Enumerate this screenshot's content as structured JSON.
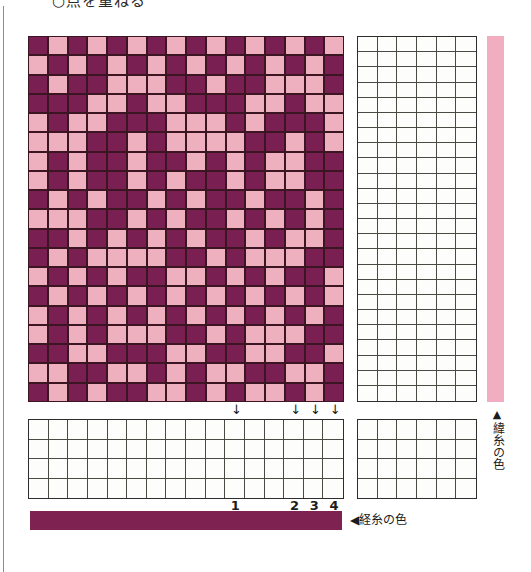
{
  "page": {
    "heading": "○点を重ねる",
    "background": "#ffffff"
  },
  "colors": {
    "warp": "#7a1f52",
    "weft": "#eeafbf",
    "warp_bar": "#7d2251",
    "weft_bar": "#f0aec0",
    "cell_outline": "#3b1622",
    "grid_line": "#4a4a42"
  },
  "drawdown": {
    "name": "woven-pattern-drawdown",
    "columns": 16,
    "rows": 19,
    "legend": {
      "warp_value": "warp",
      "weft_value": "weft"
    },
    "cells": [
      [
        "warp",
        "weft",
        "warp",
        "weft",
        "warp",
        "weft",
        "warp",
        "weft",
        "warp",
        "weft",
        "warp",
        "weft",
        "warp",
        "weft",
        "warp",
        "weft"
      ],
      [
        "weft",
        "warp",
        "weft",
        "warp",
        "weft",
        "warp",
        "weft",
        "warp",
        "weft",
        "warp",
        "weft",
        "warp",
        "weft",
        "warp",
        "weft",
        "warp"
      ],
      [
        "warp",
        "weft",
        "warp",
        "warp",
        "weft",
        "weft",
        "weft",
        "warp",
        "warp",
        "weft",
        "warp",
        "warp",
        "weft",
        "weft",
        "weft",
        "warp"
      ],
      [
        "warp",
        "warp",
        "warp",
        "weft",
        "weft",
        "warp",
        "weft",
        "weft",
        "warp",
        "warp",
        "warp",
        "weft",
        "weft",
        "warp",
        "weft",
        "weft"
      ],
      [
        "weft",
        "warp",
        "weft",
        "weft",
        "warp",
        "warp",
        "warp",
        "weft",
        "weft",
        "weft",
        "warp",
        "weft",
        "warp",
        "warp",
        "warp",
        "weft"
      ],
      [
        "weft",
        "weft",
        "weft",
        "warp",
        "warp",
        "weft",
        "warp",
        "weft",
        "weft",
        "weft",
        "weft",
        "warp",
        "warp",
        "weft",
        "warp",
        "weft"
      ],
      [
        "weft",
        "warp",
        "weft",
        "warp",
        "warp",
        "weft",
        "warp",
        "warp",
        "weft",
        "warp",
        "weft",
        "warp",
        "weft",
        "weft",
        "warp",
        "warp"
      ],
      [
        "weft",
        "warp",
        "weft",
        "warp",
        "warp",
        "weft",
        "warp",
        "weft",
        "warp",
        "warp",
        "weft",
        "warp",
        "weft",
        "weft",
        "warp",
        "warp"
      ],
      [
        "warp",
        "weft",
        "warp",
        "weft",
        "warp",
        "warp",
        "weft",
        "warp",
        "weft",
        "warp",
        "warp",
        "weft",
        "warp",
        "warp",
        "weft",
        "warp"
      ],
      [
        "weft",
        "weft",
        "weft",
        "warp",
        "warp",
        "weft",
        "warp",
        "weft",
        "warp",
        "warp",
        "weft",
        "warp",
        "weft",
        "warp",
        "weft",
        "warp"
      ],
      [
        "warp",
        "warp",
        "weft",
        "warp",
        "weft",
        "warp",
        "weft",
        "warp",
        "weft",
        "warp",
        "warp",
        "weft",
        "warp",
        "weft",
        "weft",
        "warp"
      ],
      [
        "warp",
        "weft",
        "warp",
        "weft",
        "weft",
        "weft",
        "weft",
        "warp",
        "warp",
        "weft",
        "warp",
        "weft",
        "weft",
        "weft",
        "warp",
        "warp"
      ],
      [
        "weft",
        "warp",
        "weft",
        "warp",
        "weft",
        "warp",
        "warp",
        "weft",
        "weft",
        "warp",
        "weft",
        "warp",
        "weft",
        "warp",
        "warp",
        "weft"
      ],
      [
        "warp",
        "weft",
        "warp",
        "weft",
        "warp",
        "weft",
        "warp",
        "weft",
        "warp",
        "weft",
        "warp",
        "weft",
        "warp",
        "weft",
        "warp",
        "weft"
      ],
      [
        "weft",
        "warp",
        "weft",
        "warp",
        "weft",
        "warp",
        "weft",
        "warp",
        "weft",
        "warp",
        "weft",
        "warp",
        "weft",
        "warp",
        "weft",
        "warp"
      ],
      [
        "weft",
        "warp",
        "weft",
        "warp",
        "weft",
        "weft",
        "weft",
        "warp",
        "warp",
        "weft",
        "warp",
        "weft",
        "weft",
        "weft",
        "warp",
        "warp"
      ],
      [
        "warp",
        "warp",
        "weft",
        "weft",
        "warp",
        "warp",
        "warp",
        "weft",
        "weft",
        "warp",
        "warp",
        "weft",
        "weft",
        "warp",
        "warp",
        "weft"
      ],
      [
        "weft",
        "weft",
        "warp",
        "warp",
        "weft",
        "weft",
        "warp",
        "weft",
        "warp",
        "weft",
        "weft",
        "warp",
        "warp",
        "weft",
        "weft",
        "warp"
      ],
      [
        "warp",
        "weft",
        "warp",
        "weft",
        "warp",
        "warp",
        "weft",
        "weft",
        "warp",
        "weft",
        "warp",
        "weft",
        "weft",
        "warp",
        "weft",
        "warp"
      ]
    ]
  },
  "threading_grid": {
    "name": "threading-grid",
    "columns": 6,
    "rows": 24,
    "marks": []
  },
  "treadling_grid": {
    "name": "treadling-grid",
    "columns": 16,
    "rows": 4,
    "marks": []
  },
  "tieup_grid": {
    "name": "tieup-grid",
    "columns": 6,
    "rows": 4,
    "marks": []
  },
  "treadle_markers": [
    {
      "label": "1",
      "column": 11
    },
    {
      "label": "2",
      "column": 14
    },
    {
      "label": "3",
      "column": 15
    },
    {
      "label": "4",
      "column": 16
    }
  ],
  "captions": {
    "weft_color": {
      "triangle": "▲",
      "text": "緯糸の色"
    },
    "warp_color": {
      "triangle": "◀",
      "text": "経糸の色"
    }
  }
}
